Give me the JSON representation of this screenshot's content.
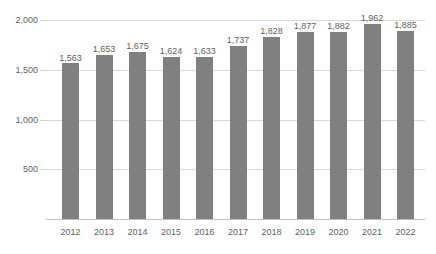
{
  "chart_data": {
    "type": "bar",
    "title": "",
    "subtitle": "",
    "xlabel": "",
    "ylabel": "",
    "categories": [
      "2012",
      "2013",
      "2014",
      "2015",
      "2016",
      "2017",
      "2018",
      "2019",
      "2020",
      "2021",
      "2022"
    ],
    "values": [
      1563,
      1653,
      1675,
      1624,
      1633,
      1737,
      1828,
      1877,
      1882,
      1962,
      1885
    ],
    "data_labels": [
      "1,563",
      "1,653",
      "1,675",
      "1,624",
      "1,633",
      "1,737",
      "1,828",
      "1,877",
      "1,882",
      "1,962",
      "1,885"
    ],
    "ylim": [
      0,
      2000
    ],
    "y_ticks": [
      0,
      500,
      1000,
      1500,
      2000
    ],
    "y_tick_labels": [
      "",
      "500",
      "1,000",
      "1,500",
      "2,000"
    ],
    "grid": true,
    "grid_axis": "y",
    "legend": false,
    "legend_position": "none",
    "series": [
      {
        "name": "",
        "values": [
          1563,
          1653,
          1675,
          1624,
          1633,
          1737,
          1828,
          1877,
          1882,
          1962,
          1885
        ],
        "color": "#808080"
      }
    ]
  },
  "colors": {
    "bar": "#808080",
    "gridline": "#d9d9d9",
    "axis": "#bfbfbf",
    "text": "#5f5f5f",
    "background": "#ffffff"
  },
  "axis": {
    "y_labels": [
      {
        "text": "2,000",
        "value": 2000
      },
      {
        "text": "1,500",
        "value": 1500
      },
      {
        "text": "1,000",
        "value": 1000
      },
      {
        "text": "500",
        "value": 500
      }
    ],
    "x_labels": [
      {
        "text": "2012"
      },
      {
        "text": "2013"
      },
      {
        "text": "2014"
      },
      {
        "text": "2015"
      },
      {
        "text": "2016"
      },
      {
        "text": "2017"
      },
      {
        "text": "2018"
      },
      {
        "text": "2019"
      },
      {
        "text": "2020"
      },
      {
        "text": "2021"
      },
      {
        "text": "2022"
      }
    ]
  }
}
